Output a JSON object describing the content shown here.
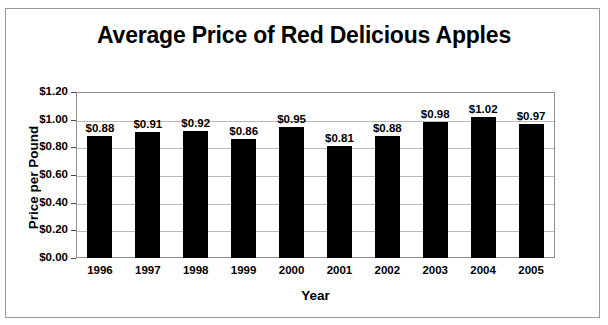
{
  "chart_data": {
    "type": "bar",
    "title": "Average Price of Red Delicious Apples",
    "xlabel": "Year",
    "ylabel": "Price per Pound",
    "categories": [
      "1996",
      "1997",
      "1998",
      "1999",
      "2000",
      "2001",
      "2002",
      "2003",
      "2004",
      "2005"
    ],
    "values": [
      0.88,
      0.91,
      0.92,
      0.86,
      0.95,
      0.81,
      0.88,
      0.98,
      1.02,
      0.97
    ],
    "value_labels": [
      "$0.88",
      "$0.91",
      "$0.92",
      "$0.86",
      "$0.95",
      "$0.81",
      "$0.88",
      "$0.98",
      "$1.02",
      "$0.97"
    ],
    "ylim": [
      0.0,
      1.2
    ],
    "ytick_values": [
      1.2,
      1.0,
      0.8,
      0.6,
      0.4,
      0.2,
      0.0
    ],
    "ytick_labels": [
      "$1.20",
      "$1.00",
      "$0.80",
      "$0.60",
      "$0.40",
      "$0.20",
      "$0.00"
    ],
    "grid": true,
    "legend": false,
    "bar_color": "#000000",
    "gridline_color": "#b8b8b8",
    "plot_border_color": "#8e8e8e",
    "figure_border_color": "#9a9a9a",
    "background_color": "#ffffff"
  }
}
